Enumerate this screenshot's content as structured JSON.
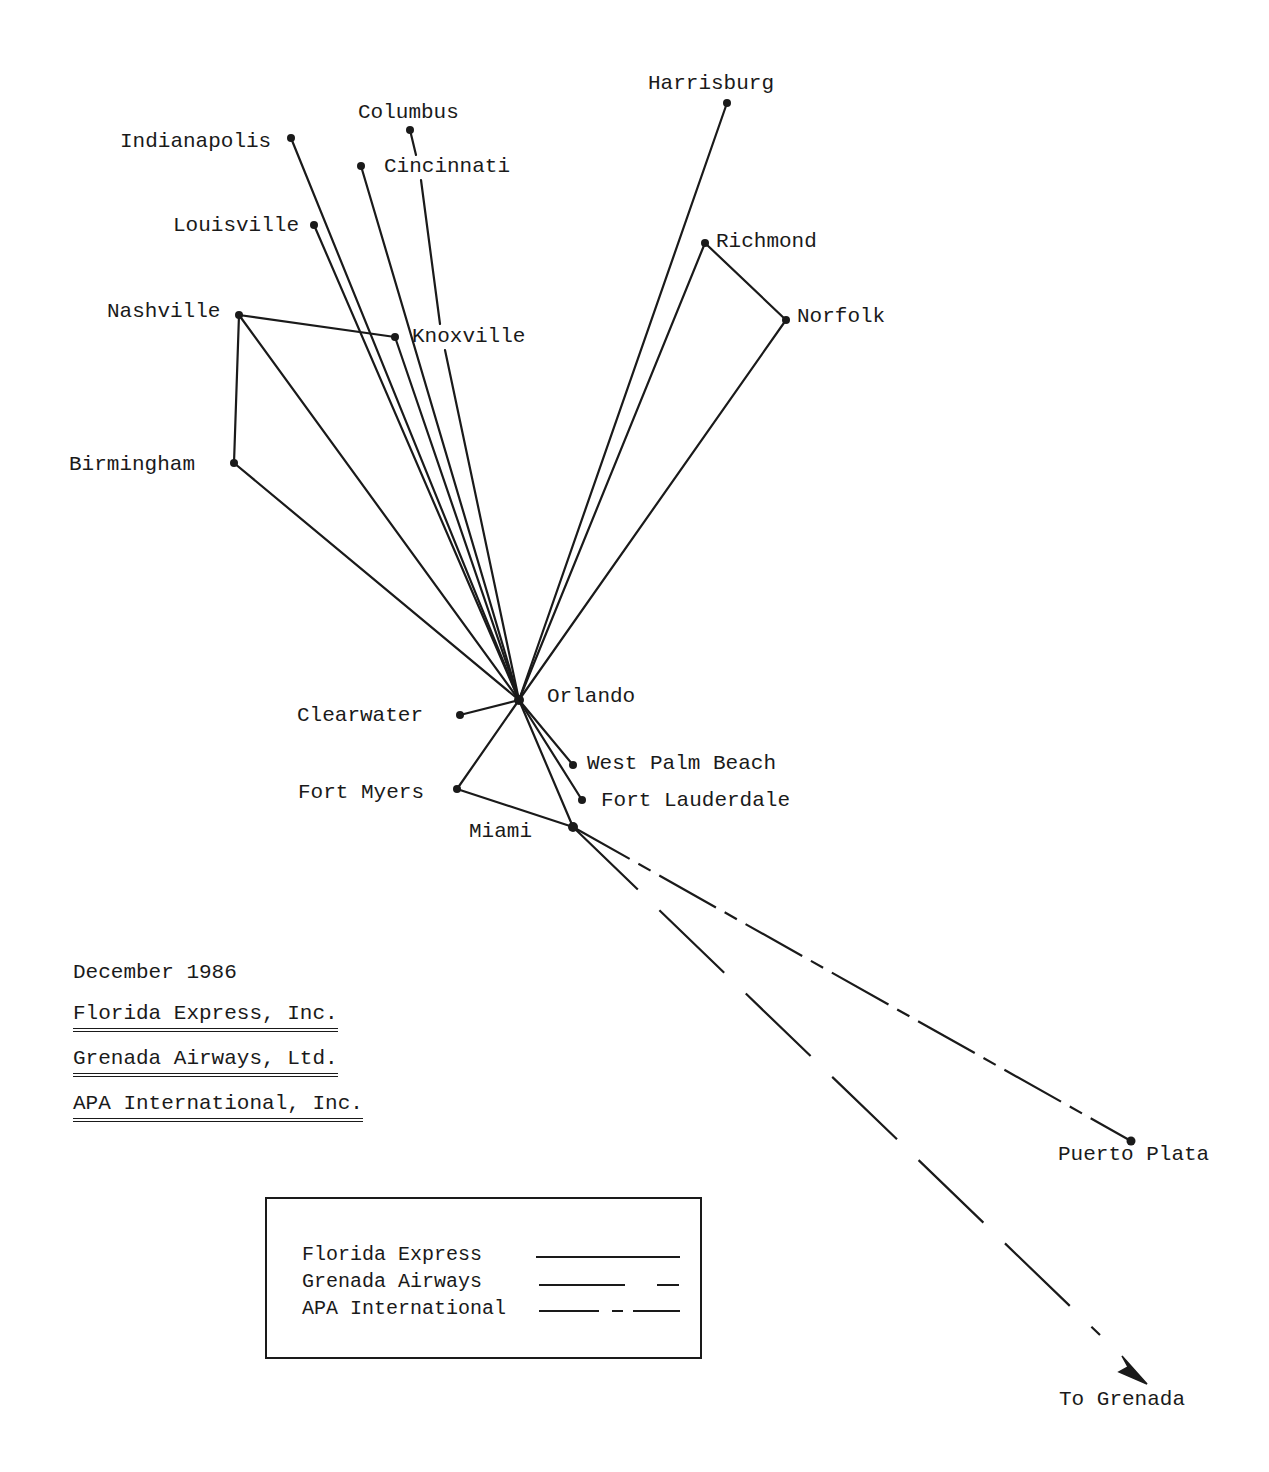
{
  "title_block": {
    "date": "December 1986",
    "carriers": [
      "Florida Express, Inc.",
      "Grenada Airways, Ltd.",
      "APA International, Inc."
    ]
  },
  "legend": {
    "items": [
      {
        "label": "Florida Express",
        "style": "solid"
      },
      {
        "label": "Grenada Airways",
        "style": "long-dash"
      },
      {
        "label": "APA International",
        "style": "dash-dot"
      }
    ]
  },
  "hub": {
    "name": "Orlando"
  },
  "cities": {
    "harrisburg": "Harrisburg",
    "columbus": "Columbus",
    "indianapolis": "Indianapolis",
    "cincinnati": "Cincinnati",
    "louisville": "Louisville",
    "richmond": "Richmond",
    "norfolk": "Norfolk",
    "nashville": "Nashville",
    "knoxville": "Knoxville",
    "birmingham": "Birmingham",
    "orlando": "Orlando",
    "clearwater": "Clearwater",
    "west_palm_beach": "West Palm Beach",
    "fort_myers": "Fort Myers",
    "fort_lauderdale": "Fort Lauderdale",
    "miami": "Miami",
    "puerto_plata": "Puerto Plata",
    "to_grenada": "To Grenada"
  },
  "routes": [
    {
      "carrier": "Florida Express",
      "from": "Orlando",
      "to": "Harrisburg"
    },
    {
      "carrier": "Florida Express",
      "from": "Orlando",
      "to": "Richmond"
    },
    {
      "carrier": "Florida Express",
      "from": "Richmond",
      "to": "Norfolk"
    },
    {
      "carrier": "Florida Express",
      "from": "Orlando",
      "to": "Norfolk"
    },
    {
      "carrier": "Florida Express",
      "from": "Orlando",
      "to": "Indianapolis"
    },
    {
      "carrier": "Florida Express",
      "from": "Orlando",
      "to": "Columbus"
    },
    {
      "carrier": "Florida Express",
      "from": "Orlando",
      "to": "Cincinnati"
    },
    {
      "carrier": "Florida Express",
      "from": "Orlando",
      "to": "Louisville"
    },
    {
      "carrier": "Florida Express",
      "from": "Orlando",
      "to": "Knoxville"
    },
    {
      "carrier": "Florida Express",
      "from": "Nashville",
      "to": "Knoxville"
    },
    {
      "carrier": "Florida Express",
      "from": "Orlando",
      "to": "Nashville"
    },
    {
      "carrier": "Florida Express",
      "from": "Nashville",
      "to": "Birmingham"
    },
    {
      "carrier": "Florida Express",
      "from": "Orlando",
      "to": "Birmingham"
    },
    {
      "carrier": "Florida Express",
      "from": "Orlando",
      "to": "Clearwater"
    },
    {
      "carrier": "Florida Express",
      "from": "Orlando",
      "to": "West Palm Beach"
    },
    {
      "carrier": "Florida Express",
      "from": "Orlando",
      "to": "Fort Lauderdale"
    },
    {
      "carrier": "Florida Express",
      "from": "Orlando",
      "to": "Fort Myers"
    },
    {
      "carrier": "Florida Express",
      "from": "Fort Myers",
      "to": "Miami"
    },
    {
      "carrier": "Florida Express",
      "from": "Orlando",
      "to": "Miami"
    },
    {
      "carrier": "Grenada Airways",
      "from": "Miami",
      "to": "Grenada"
    },
    {
      "carrier": "APA International",
      "from": "Miami",
      "to": "Puerto Plata"
    }
  ],
  "colors": {
    "ink": "#1a1a1a",
    "paper": "#ffffff"
  }
}
